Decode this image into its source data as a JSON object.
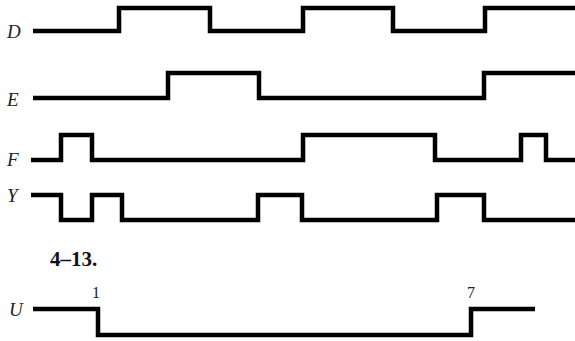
{
  "signals": [
    {
      "name": "D",
      "label_x": 7,
      "label_y": 38,
      "high_y": 8,
      "low_y": 31,
      "points": [
        [
          33,
          "L"
        ],
        [
          119,
          "H"
        ],
        [
          210,
          "L"
        ],
        [
          303,
          "H"
        ],
        [
          393,
          "L"
        ],
        [
          485,
          "H"
        ],
        [
          575,
          "H"
        ]
      ]
    },
    {
      "name": "E",
      "label_x": 7,
      "label_y": 106,
      "high_y": 73,
      "low_y": 98,
      "points": [
        [
          33,
          "L"
        ],
        [
          168,
          "H"
        ],
        [
          259,
          "L"
        ],
        [
          484,
          "H"
        ],
        [
          575,
          "H"
        ]
      ]
    },
    {
      "name": "F",
      "label_x": 7,
      "label_y": 166,
      "high_y": 135,
      "low_y": 160,
      "points": [
        [
          31,
          "L"
        ],
        [
          61,
          "H"
        ],
        [
          92,
          "L"
        ],
        [
          303,
          "H"
        ],
        [
          435,
          "L"
        ],
        [
          521,
          "H"
        ],
        [
          546,
          "L"
        ],
        [
          575,
          "L"
        ]
      ]
    },
    {
      "name": "Y",
      "label_x": 7,
      "label_y": 202,
      "high_y": 195,
      "low_y": 220,
      "points": [
        [
          31,
          "H"
        ],
        [
          61,
          "L"
        ],
        [
          92,
          "H"
        ],
        [
          122,
          "L"
        ],
        [
          258,
          "H"
        ],
        [
          302,
          "L"
        ],
        [
          437,
          "H"
        ],
        [
          484,
          "L"
        ],
        [
          575,
          "L"
        ]
      ]
    }
  ],
  "section_title": "4–13.",
  "section_title_pos": [
    50,
    266
  ],
  "u_signal": {
    "name": "U",
    "label_x": 9,
    "label_y": 316,
    "high_y": 309,
    "low_y": 335,
    "points": [
      [
        33,
        "H"
      ],
      [
        98,
        "L"
      ],
      [
        471,
        "H"
      ],
      [
        535,
        "H"
      ]
    ],
    "markers": [
      {
        "text": "1",
        "x": 92,
        "y": 298
      },
      {
        "text": "7",
        "x": 467,
        "y": 298
      }
    ]
  }
}
